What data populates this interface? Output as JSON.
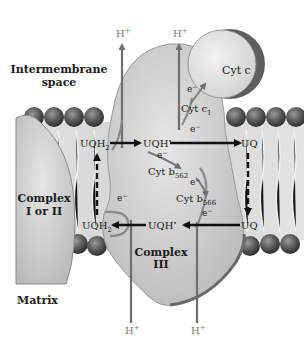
{
  "regions": {
    "intermembrane_line1": "Intermembrane",
    "intermembrane_line2": "space",
    "matrix": "Matrix"
  },
  "complexes": {
    "left_line1": "Complex",
    "left_line2": "I or II",
    "center_line1": "Complex",
    "center_line2": "III",
    "cyt_c": "Cyt c"
  },
  "carriers": {
    "cyt_c1": "Cyt c",
    "cyt_c1_sub": "1",
    "cyt_b562": "Cyt b",
    "cyt_b562_sub": "562",
    "cyt_b566": "Cyt b",
    "cyt_b566_sub": "566"
  },
  "quinones": {
    "uqh2_top": "UQH",
    "uqh2_top_sub": "2",
    "uqh_radical_top": "UQH",
    "uqh_radical_top_sup": "•",
    "uq_top_right": "UQ",
    "uqh2_bottom": "UQH",
    "uqh2_bottom_sub": "2",
    "uqh_radical_bottom": "UQH",
    "uqh_radical_bottom_sup": "•",
    "uq_bottom_right": "UQ"
  },
  "protons": {
    "top_left": "H",
    "top_right": "H",
    "bottom_left": "H",
    "bottom_right": "H",
    "charge": "+"
  },
  "electron": "e",
  "electron_charge": "−",
  "colors": {
    "protein": "#c8c8c8",
    "protein_edge": "#8a8a8a",
    "lipid_head": "#5a5a5a",
    "membrane_tail": "#dcdcdc",
    "arrow_black": "#111111",
    "arrow_gray": "#6e6e6e"
  }
}
